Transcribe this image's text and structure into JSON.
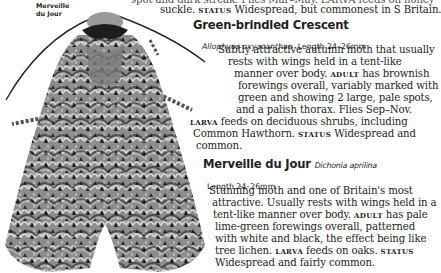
{
  "illustration": {
    "caption_line1": "Merveille",
    "caption_line2": "du Jour",
    "subject": "moth-illustration-merveille-du-jour"
  },
  "prev_entry": {
    "line_cut": "spot and dark streak. Flies Mar–May. LARVA feeds on honey-",
    "line2_text": "suckle. ",
    "line2_status_label": "STATUS",
    "line2_status": " Widespread, but commonest in S Britain."
  },
  "entries": [
    {
      "title": "Green-brindled Crescent",
      "scientific_name": "Allophyes oxyacanthae",
      "length": "Length 24–26mm",
      "lines": [
        "Subtly attractive autumn moth that usually",
        "rests with wings held in a tent-like",
        "manner over body.",
        "has brownish",
        "forewings overall, variably marked with",
        "green and showing 2 large, pale spots,",
        "and a palish thorax. Flies Sep–Nov.",
        "feeds on deciduous shrubs, including",
        "Common Hawthorn.",
        "Widespread and",
        "common."
      ],
      "labels": {
        "adult": "ADULT",
        "larva": "LARVA",
        "status": "STATUS"
      }
    },
    {
      "title": "Merveille du Jour",
      "scientific_name": "Dichonia aprilina",
      "length": "Length 24–26mm",
      "lines": [
        "Stunning moth and one of Britain's most",
        "attractive. Usually rests with wings held in a",
        "tent-like manner over body.",
        "has pale",
        "lime-green forewings overall, patterned",
        "with white and black, the effect being like",
        "tree lichen.",
        "feeds on oaks.",
        "Widespread and fairly common."
      ],
      "labels": {
        "adult": "ADULT",
        "larva": "LARVA",
        "status": "STATUS"
      }
    }
  ]
}
